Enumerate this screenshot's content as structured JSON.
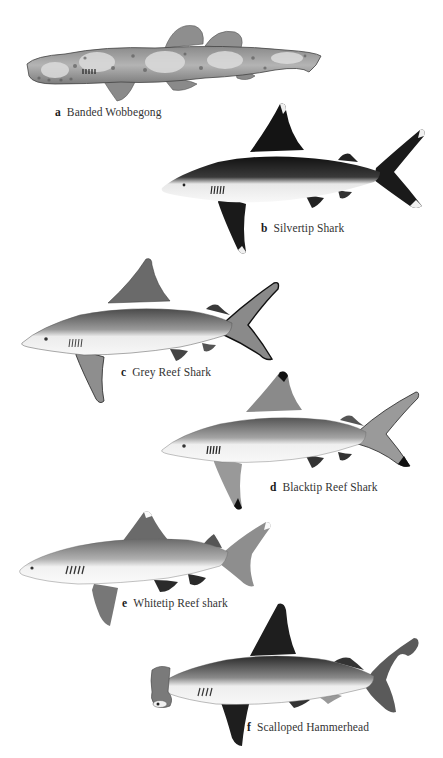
{
  "plate": {
    "description": "Illustrated plate of six shark species",
    "figures": [
      {
        "letter": "a",
        "name": "Banded Wobbegong",
        "shading": "mottled",
        "color_body": "#9c9c9c",
        "color_spots": "#d8d8d8"
      },
      {
        "letter": "b",
        "name": "Silvertip Shark",
        "shading": "dark-dorsal-white-tips",
        "color_body": "#1e1e1e",
        "color_belly": "#f2f2f2"
      },
      {
        "letter": "c",
        "name": "Grey Reef Shark",
        "shading": "grey-dorsal-black-tail-margin",
        "color_body": "#6e6e6e",
        "color_belly": "#f4f4f4"
      },
      {
        "letter": "d",
        "name": "Blacktip Reef Shark",
        "shading": "grey-black-fin-tips",
        "color_body": "#7a7a7a",
        "color_belly": "#f4f4f4"
      },
      {
        "letter": "e",
        "name": "Whitetip Reef shark",
        "shading": "grey-white-fin-tips",
        "color_body": "#8a8a8a",
        "color_belly": "#f6f6f6"
      },
      {
        "letter": "f",
        "name": "Scalloped Hammerhead",
        "shading": "dark-grey-hammer-head",
        "color_body": "#3e3e3e",
        "color_belly": "#f4f4f4"
      }
    ]
  }
}
